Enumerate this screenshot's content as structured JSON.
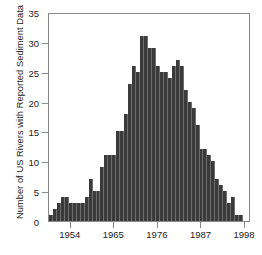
{
  "chart_data": {
    "type": "bar",
    "title": "",
    "xlabel": "",
    "ylabel": "Number of US Rivers with Reported Sediment Data",
    "xlim": [
      1948.5,
      1999.5
    ],
    "ylim": [
      0,
      35
    ],
    "grid": false,
    "legend": null,
    "bar_color": "#3a3a3a",
    "axis_color": "#8a8a8a",
    "x_ticks": [
      1954,
      1965,
      1976,
      1987,
      1998
    ],
    "x_tick_labels": [
      "1954",
      "1965",
      "1976",
      "1987",
      "1998"
    ],
    "y_ticks": [
      0,
      5,
      10,
      15,
      20,
      25,
      30,
      35
    ],
    "y_tick_labels": [
      "0",
      "5",
      "10",
      "15",
      "20",
      "25",
      "30",
      "35"
    ],
    "categories": [
      1949,
      1950,
      1951,
      1952,
      1953,
      1954,
      1955,
      1956,
      1957,
      1958,
      1959,
      1960,
      1961,
      1962,
      1963,
      1964,
      1965,
      1966,
      1967,
      1968,
      1969,
      1970,
      1971,
      1972,
      1973,
      1974,
      1975,
      1976,
      1977,
      1978,
      1979,
      1980,
      1981,
      1982,
      1983,
      1984,
      1985,
      1986,
      1987,
      1988,
      1989,
      1990,
      1991,
      1992,
      1993,
      1994,
      1995,
      1996,
      1997
    ],
    "values": [
      1,
      2,
      3,
      4,
      4,
      3,
      3,
      3,
      3,
      4,
      7,
      5,
      5,
      9,
      11,
      11,
      11,
      15,
      15,
      18,
      23,
      26,
      25,
      31,
      31,
      29,
      29,
      26,
      25,
      25,
      24,
      26,
      27,
      26,
      22,
      20,
      19,
      16,
      12,
      12,
      11,
      10,
      7,
      6,
      5,
      3,
      4,
      1,
      1
    ]
  }
}
